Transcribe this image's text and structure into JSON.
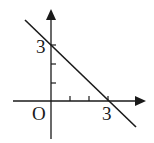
{
  "diagram": {
    "type": "coordinate-plane-line-graph",
    "equation": "y = -x + 3",
    "labels": {
      "origin": "O",
      "x_intercept": "3",
      "y_intercept": "3"
    },
    "x_ticks": [
      1,
      2,
      3
    ],
    "y_ticks": [
      1,
      2,
      3
    ],
    "line": {
      "x_intercept": 3,
      "y_intercept": 3,
      "slope": -1
    },
    "colors": {
      "stroke": "#1a1a1a",
      "background": "#ffffff"
    }
  }
}
